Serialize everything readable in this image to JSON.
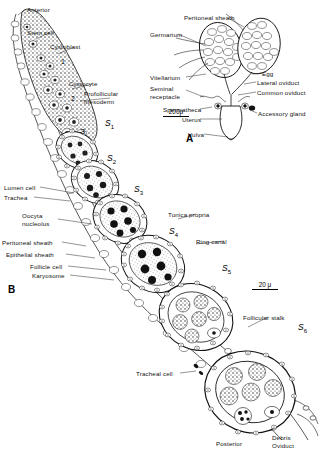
{
  "figure": {
    "background": "#ffffff",
    "ink": "#111111",
    "width": 325,
    "height": 454
  },
  "panels": [
    {
      "id": "A",
      "label": "A",
      "x": 186,
      "y": 133,
      "caption": "Female reproductive system",
      "scale_bar": {
        "text": "200μ",
        "x": 163,
        "y": 108,
        "length_px": 26
      }
    },
    {
      "id": "B",
      "label": "B",
      "x": 8,
      "y": 284,
      "caption": "Ovariole showing germarium and vitellarium stages",
      "scale_bar": {
        "text": "20 μ",
        "x": 252,
        "y": 281,
        "length_px": 26
      }
    }
  ],
  "panel_b_labels": [
    {
      "name": "anterior",
      "text": "Anterior",
      "x": 27,
      "y": 6,
      "leader_to": [
        16,
        16
      ]
    },
    {
      "name": "stem-cell",
      "text": "Stem cell",
      "x": 27,
      "y": 29,
      "leader_to": [
        22,
        37
      ]
    },
    {
      "name": "cystoblast",
      "text": "Cystoblast",
      "x": 50,
      "y": 43,
      "leader_to": [
        36,
        52
      ]
    },
    {
      "name": "cystocyte",
      "text": "Cystocyte",
      "x": 69,
      "y": 80,
      "leader_to": [
        54,
        87
      ]
    },
    {
      "name": "profollicular-mesoderm",
      "text": "Profollicular\nmesoderm",
      "x": 84,
      "y": 90,
      "leader_to": [
        66,
        96
      ]
    },
    {
      "name": "lumen-cell",
      "text": "Lumen cell",
      "x": 4,
      "y": 184,
      "leader_to": [
        72,
        192
      ]
    },
    {
      "name": "trachea",
      "text": "Trachea",
      "x": 4,
      "y": 194,
      "leader_to": [
        68,
        200
      ]
    },
    {
      "name": "oocyte-nucleolus",
      "text": "Oocyta\nnucleolus",
      "x": 22,
      "y": 212,
      "leader_to": [
        90,
        222
      ]
    },
    {
      "name": "peritoneal-sheath-b",
      "text": "Peritoneal sheath",
      "x": 2,
      "y": 239,
      "leader_to": [
        84,
        244
      ]
    },
    {
      "name": "epithelial-sheath",
      "text": "Epithelial sheath",
      "x": 6,
      "y": 251,
      "leader_to": [
        92,
        256
      ]
    },
    {
      "name": "follicle-cell",
      "text": "Follicle cell",
      "x": 30,
      "y": 263,
      "leader_to": [
        104,
        268
      ]
    },
    {
      "name": "karyosome",
      "text": "Karyosome",
      "x": 32,
      "y": 272,
      "leader_to": [
        112,
        278
      ]
    },
    {
      "name": "tunica-propria",
      "text": "Tunica propria",
      "x": 168,
      "y": 211,
      "leader_to": [
        152,
        219
      ]
    },
    {
      "name": "ring-canal",
      "text": "Ring canal",
      "x": 196,
      "y": 238,
      "leader_to": [
        166,
        242
      ]
    },
    {
      "name": "follicular-stalk",
      "text": "Follicular stalk",
      "x": 243,
      "y": 314,
      "leader_to": [
        236,
        324
      ]
    },
    {
      "name": "tracheal-cell",
      "text": "Tracheal cell",
      "x": 136,
      "y": 370,
      "leader_to": [
        190,
        372
      ]
    },
    {
      "name": "posterior",
      "text": "Posterior",
      "x": 216,
      "y": 440,
      "leader_to": null
    },
    {
      "name": "debris",
      "text": "Debris",
      "x": 272,
      "y": 434,
      "leader_to": null
    },
    {
      "name": "oviduct",
      "text": "Oviduct",
      "x": 272,
      "y": 442,
      "leader_to": null
    }
  ],
  "panel_b_numbers": [
    {
      "name": "region-1",
      "text": "1",
      "x": 61,
      "y": 58
    },
    {
      "name": "region-2",
      "text": "2",
      "x": 71,
      "y": 95
    },
    {
      "name": "region-3",
      "text": "3",
      "x": 81,
      "y": 128
    }
  ],
  "stages": [
    {
      "name": "stage-s1",
      "label": "S",
      "sub": "1",
      "x": 105,
      "y": 118
    },
    {
      "name": "stage-s2",
      "label": "S",
      "sub": "2",
      "x": 107,
      "y": 153
    },
    {
      "name": "stage-s3",
      "label": "S",
      "sub": "3",
      "x": 134,
      "y": 184
    },
    {
      "name": "stage-s4",
      "label": "S",
      "sub": "4",
      "x": 169,
      "y": 226
    },
    {
      "name": "stage-s5",
      "label": "S",
      "sub": "5",
      "x": 222,
      "y": 263
    },
    {
      "name": "stage-s6",
      "label": "S",
      "sub": "6",
      "x": 298,
      "y": 322
    }
  ],
  "panel_a_labels": [
    {
      "name": "peritoneal-sheath-a",
      "text": "Peritoneal sheath",
      "x": 184,
      "y": 14,
      "leader_to": [
        230,
        26
      ]
    },
    {
      "name": "germarium",
      "text": "Germarium",
      "x": 150,
      "y": 31,
      "leader_to": [
        206,
        44
      ]
    },
    {
      "name": "vitellarium",
      "text": "Vitellarium",
      "x": 150,
      "y": 74,
      "leader_to": [
        206,
        72
      ]
    },
    {
      "name": "seminal-receptacle",
      "text": "Seminal\nreceptacle",
      "x": 150,
      "y": 85,
      "leader_to": [
        201,
        96
      ]
    },
    {
      "name": "spermatheca",
      "text": "Spermatheca",
      "x": 163,
      "y": 106,
      "leader_to": [
        205,
        110
      ]
    },
    {
      "name": "uterus",
      "text": "Uterus",
      "x": 182,
      "y": 116,
      "leader_to": [
        216,
        118
      ]
    },
    {
      "name": "vulva",
      "text": "Vulva",
      "x": 188,
      "y": 131,
      "leader_to": [
        219,
        134
      ]
    },
    {
      "name": "egg",
      "text": "Egg",
      "x": 262,
      "y": 70,
      "leader_to": [
        254,
        72
      ]
    },
    {
      "name": "lateral-oviduct",
      "text": "Lateral oviduct",
      "x": 257,
      "y": 79,
      "leader_to": [
        248,
        82
      ]
    },
    {
      "name": "common-oviduct",
      "text": "Common oviduct",
      "x": 257,
      "y": 89,
      "leader_to": [
        246,
        92
      ]
    },
    {
      "name": "accessory-gland",
      "text": "Accessory gland",
      "x": 258,
      "y": 110,
      "leader_to": [
        240,
        112
      ]
    }
  ]
}
